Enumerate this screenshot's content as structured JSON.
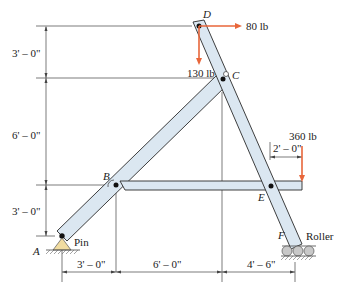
{
  "diagram": {
    "type": "frame-structure",
    "points": {
      "A": {
        "label": "A",
        "support": "Pin"
      },
      "B": {
        "label": "B"
      },
      "C": {
        "label": "C"
      },
      "D": {
        "label": "D"
      },
      "E": {
        "label": "E"
      },
      "F": {
        "label": "F",
        "support": "Roller"
      }
    },
    "supports": {
      "pin_label": "Pin",
      "roller_label": "Roller"
    },
    "forces": [
      {
        "id": "force-80",
        "label": "80 lb",
        "at": "D",
        "direction": "right"
      },
      {
        "id": "force-130",
        "label": "130 lb",
        "at": "D",
        "direction": "down"
      },
      {
        "id": "force-360",
        "label": "360 lb",
        "at": "right end of member BE",
        "direction": "down"
      }
    ],
    "dimensions": {
      "vertical": [
        "3' – 0\"",
        "6' – 0\"",
        "3' – 0\""
      ],
      "horizontal": [
        "3' – 0\"",
        "6' – 0\"",
        "4' – 6\""
      ],
      "overhang": "2' – 0\""
    },
    "colors": {
      "member_fill": "#dbe7f1",
      "member_stroke": "#2a2a2a",
      "force": "#e8663a",
      "pin_fill": "#f1dca0",
      "roller_fill": "#c8c8c8"
    }
  }
}
